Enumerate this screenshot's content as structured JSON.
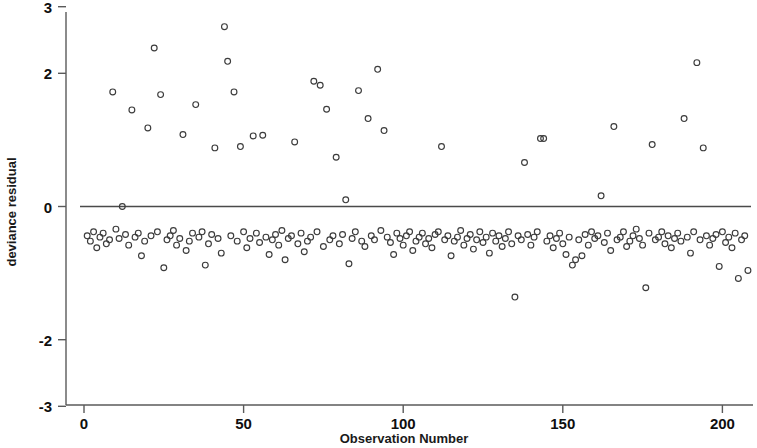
{
  "chart_data": {
    "type": "scatter",
    "title": "",
    "xlabel": "Observation Number",
    "ylabel": "deviance residual",
    "xlim": [
      -4,
      212
    ],
    "ylim": [
      -3.12,
      3.12
    ],
    "xticks": [
      0,
      50,
      100,
      150,
      200
    ],
    "xticklabels": [
      "0",
      "50",
      "100",
      "150",
      "200"
    ],
    "yticks": [
      3,
      2,
      0,
      -2,
      -3
    ],
    "yticklabels": [
      "3",
      "2",
      "0",
      "-2",
      "-3"
    ],
    "grid": false,
    "legend": null,
    "marker": "open-circle",
    "marker_color": "#3c3c3c",
    "reference_lines": [
      {
        "orientation": "horizontal",
        "value": 0,
        "color": "#4a4a4a"
      }
    ],
    "series": [
      {
        "name": "deviance residual",
        "x": [
          1,
          2,
          3,
          4,
          5,
          6,
          7,
          8,
          9,
          10,
          11,
          12,
          13,
          14,
          15,
          16,
          17,
          18,
          19,
          20,
          21,
          22,
          23,
          24,
          25,
          26,
          27,
          28,
          29,
          30,
          31,
          32,
          33,
          34,
          35,
          36,
          37,
          38,
          39,
          40,
          41,
          42,
          43,
          44,
          45,
          46,
          47,
          48,
          49,
          50,
          51,
          52,
          53,
          54,
          55,
          56,
          57,
          58,
          59,
          60,
          61,
          62,
          63,
          64,
          65,
          66,
          67,
          68,
          69,
          70,
          71,
          72,
          73,
          74,
          75,
          76,
          77,
          78,
          79,
          80,
          81,
          82,
          83,
          84,
          85,
          86,
          87,
          88,
          89,
          90,
          91,
          92,
          93,
          94,
          95,
          96,
          97,
          98,
          99,
          100,
          101,
          102,
          103,
          104,
          105,
          106,
          107,
          108,
          109,
          110,
          111,
          112,
          113,
          114,
          115,
          116,
          117,
          118,
          119,
          120,
          121,
          122,
          123,
          124,
          125,
          126,
          127,
          128,
          129,
          130,
          131,
          132,
          133,
          134,
          135,
          136,
          137,
          138,
          139,
          140,
          141,
          142,
          143,
          144,
          145,
          146,
          147,
          148,
          149,
          150,
          151,
          152,
          153,
          154,
          155,
          156,
          157,
          158,
          159,
          160,
          161,
          162,
          163,
          164,
          165,
          166,
          167,
          168,
          169,
          170,
          171,
          172,
          173,
          174,
          175,
          176,
          177,
          178,
          179,
          180,
          181,
          182,
          183,
          184,
          185,
          186,
          187,
          188,
          189,
          190,
          191,
          192,
          193,
          194,
          195,
          196,
          197,
          198,
          199,
          200,
          201,
          202,
          203,
          204,
          205,
          206,
          207,
          208
        ],
        "y": [
          -0.44,
          -0.52,
          -0.38,
          -0.62,
          -0.46,
          -0.4,
          -0.56,
          -0.5,
          1.72,
          -0.34,
          -0.48,
          0.0,
          -0.42,
          -0.58,
          1.45,
          -0.46,
          -0.4,
          -0.74,
          -0.52,
          1.18,
          -0.44,
          2.38,
          -0.38,
          1.68,
          -0.92,
          -0.5,
          -0.44,
          -0.36,
          -0.58,
          -0.48,
          1.08,
          -0.66,
          -0.52,
          -0.4,
          1.53,
          -0.46,
          -0.38,
          -0.88,
          -0.56,
          -0.42,
          0.88,
          -0.48,
          -0.7,
          2.7,
          2.18,
          -0.44,
          1.72,
          -0.52,
          0.9,
          -0.38,
          -0.62,
          -0.48,
          1.06,
          -0.4,
          -0.54,
          1.07,
          -0.46,
          -0.72,
          -0.5,
          -0.42,
          -0.58,
          -0.36,
          -0.8,
          -0.48,
          -0.44,
          0.97,
          -0.56,
          -0.4,
          -0.68,
          -0.52,
          -0.46,
          1.88,
          -0.38,
          1.82,
          -0.6,
          1.46,
          -0.5,
          -0.44,
          0.74,
          -0.56,
          -0.42,
          0.1,
          -0.86,
          -0.48,
          -0.38,
          1.74,
          -0.52,
          -0.6,
          1.32,
          -0.44,
          -0.5,
          2.06,
          -0.36,
          1.14,
          -0.46,
          -0.54,
          -0.72,
          -0.4,
          -0.48,
          -0.58,
          -0.44,
          -0.38,
          -0.66,
          -0.52,
          -0.46,
          -0.4,
          -0.56,
          -0.48,
          -0.62,
          -0.42,
          -0.38,
          0.9,
          -0.5,
          -0.44,
          -0.74,
          -0.52,
          -0.46,
          -0.36,
          -0.58,
          -0.48,
          -0.42,
          -0.64,
          -0.5,
          -0.38,
          -0.54,
          -0.46,
          -0.7,
          -0.4,
          -0.52,
          -0.44,
          -0.6,
          -0.48,
          -0.38,
          -0.56,
          -1.36,
          -0.44,
          -0.5,
          0.66,
          -0.42,
          -0.58,
          -0.46,
          -0.38,
          1.02,
          1.02,
          -0.52,
          -0.44,
          -0.62,
          -0.48,
          -0.4,
          -0.56,
          -0.72,
          -0.46,
          -0.88,
          -0.8,
          -0.5,
          -0.74,
          -0.42,
          -0.58,
          -0.38,
          -0.48,
          -0.44,
          0.16,
          -0.54,
          -0.4,
          -0.66,
          1.2,
          -0.5,
          -0.46,
          -0.38,
          -0.6,
          -0.52,
          -0.44,
          -0.34,
          -0.48,
          -0.58,
          -1.22,
          -0.4,
          0.93,
          -0.5,
          -0.46,
          -0.38,
          -0.56,
          -0.44,
          -0.62,
          -0.48,
          -0.4,
          -0.52,
          1.32,
          -0.46,
          -0.7,
          -0.38,
          2.16,
          -0.5,
          0.88,
          -0.44,
          -0.58,
          -0.48,
          -0.42,
          -0.9,
          -0.38,
          -0.54,
          -0.46,
          -0.62,
          -0.4,
          -1.08,
          -0.5,
          -0.44,
          -0.96
        ]
      }
    ]
  }
}
